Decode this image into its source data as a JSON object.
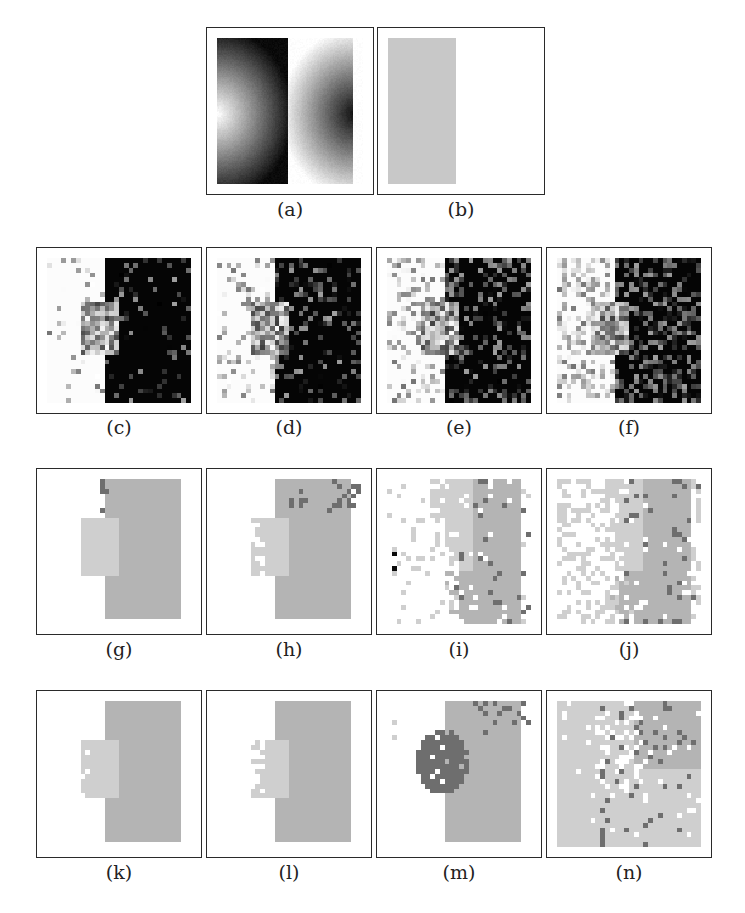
{
  "figure": {
    "panels": [
      {
        "id": "a",
        "label": "(a)",
        "x": 206,
        "y": 27,
        "w": 168,
        "h": 168,
        "kind": "gradient",
        "label_y": 198
      },
      {
        "id": "b",
        "label": "(b)",
        "x": 377,
        "y": 27,
        "w": 168,
        "h": 168,
        "kind": "flat",
        "label_y": 198
      },
      {
        "id": "c",
        "label": "(c)",
        "x": 36,
        "y": 247,
        "w": 166,
        "h": 167,
        "kind": "noisy",
        "noise": 0.12,
        "seed": 11,
        "label_y": 416
      },
      {
        "id": "d",
        "label": "(d)",
        "x": 206,
        "y": 247,
        "w": 166,
        "h": 167,
        "kind": "noisy",
        "noise": 0.22,
        "seed": 23,
        "label_y": 416
      },
      {
        "id": "e",
        "label": "(e)",
        "x": 376,
        "y": 247,
        "w": 166,
        "h": 167,
        "kind": "noisy",
        "noise": 0.34,
        "seed": 37,
        "label_y": 416
      },
      {
        "id": "f",
        "label": "(f)",
        "x": 546,
        "y": 247,
        "w": 166,
        "h": 167,
        "kind": "noisy",
        "noise": 0.42,
        "seed": 53,
        "label_y": 416
      },
      {
        "id": "g",
        "label": "(g)",
        "x": 36,
        "y": 468,
        "w": 166,
        "h": 167,
        "kind": "seg",
        "variant": "g",
        "seed": 61,
        "label_y": 638
      },
      {
        "id": "h",
        "label": "(h)",
        "x": 206,
        "y": 468,
        "w": 166,
        "h": 167,
        "kind": "seg",
        "variant": "h",
        "seed": 71,
        "label_y": 638
      },
      {
        "id": "i",
        "label": "(i)",
        "x": 376,
        "y": 468,
        "w": 166,
        "h": 167,
        "kind": "seg",
        "variant": "i",
        "seed": 83,
        "label_y": 638
      },
      {
        "id": "j",
        "label": "(j)",
        "x": 546,
        "y": 468,
        "w": 166,
        "h": 167,
        "kind": "seg",
        "variant": "j",
        "seed": 97,
        "label_y": 638
      },
      {
        "id": "k",
        "label": "(k)",
        "x": 36,
        "y": 690,
        "w": 166,
        "h": 168,
        "kind": "seg",
        "variant": "k",
        "seed": 101,
        "label_y": 861
      },
      {
        "id": "l",
        "label": "(l)",
        "x": 206,
        "y": 690,
        "w": 166,
        "h": 168,
        "kind": "seg",
        "variant": "l",
        "seed": 113,
        "label_y": 861
      },
      {
        "id": "m",
        "label": "(m)",
        "x": 376,
        "y": 690,
        "w": 166,
        "h": 168,
        "kind": "seg",
        "variant": "m",
        "seed": 127,
        "label_y": 861
      },
      {
        "id": "n",
        "label": "(n)",
        "x": 546,
        "y": 690,
        "w": 166,
        "h": 168,
        "kind": "seg",
        "variant": "n",
        "seed": 139,
        "label_y": 861
      }
    ],
    "colors": {
      "border": "#2a2a2a",
      "white": "#ffffff",
      "light_gray": "#cfcfcf",
      "mid_gray": "#b4b4b4",
      "dark_gray": "#6e6e6e",
      "black": "#0a0a0a"
    }
  }
}
